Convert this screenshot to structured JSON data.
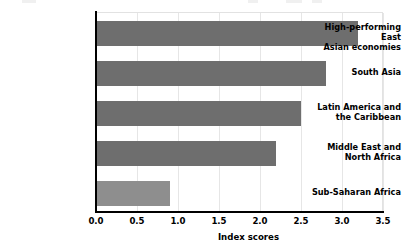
{
  "chart_data": {
    "type": "bar",
    "orientation": "horizontal",
    "title": "",
    "subtitle": "",
    "xlabel": "Index scores",
    "ylabel": "",
    "xlim": [
      0.0,
      3.5
    ],
    "xticks": [
      "0.0",
      "0.5",
      "1.0",
      "1.5",
      "2.0",
      "2.5",
      "3.0",
      "3.5"
    ],
    "xtick_values": [
      0.0,
      0.5,
      1.0,
      1.5,
      2.0,
      2.5,
      3.0,
      3.5
    ],
    "grid": "vertical-only",
    "legend": "none",
    "categories": [
      "High-performing East\nAsian economies",
      "South Asia",
      "Latin America and\nthe Caribbean",
      "Middle East and\nNorth Africa",
      "Sub-Saharan Africa"
    ],
    "values": [
      3.2,
      2.8,
      2.5,
      2.2,
      0.9
    ],
    "bar_colors": [
      "#6e6e6e",
      "#6e6e6e",
      "#6e6e6e",
      "#6e6e6e",
      "#8e8e8e"
    ]
  },
  "colors": {
    "bar_dark": "#6e6e6e",
    "bar_light": "#8e8e8e",
    "axis": "#000000",
    "gridline": "#e6e6e6",
    "frame": "#e2e2e2",
    "background": "#ffffff",
    "text": "#000000"
  }
}
